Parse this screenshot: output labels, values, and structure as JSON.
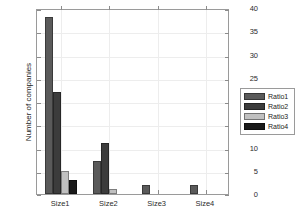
{
  "chart_data": {
    "type": "bar",
    "title": "",
    "xlabel": "",
    "ylabel": "Number of companies",
    "categories": [
      "Size1",
      "Size2",
      "Size3",
      "Size4"
    ],
    "series": [
      {
        "name": "Ratio1",
        "values": [
          38,
          7,
          2,
          2
        ],
        "color": "#5a5a5a"
      },
      {
        "name": "Ratio2",
        "values": [
          22,
          11,
          0,
          0
        ],
        "color": "#3c3c3c"
      },
      {
        "name": "Ratio3",
        "values": [
          5,
          1,
          0,
          0
        ],
        "color": "#c0c0c0"
      },
      {
        "name": "Ratio4",
        "values": [
          3,
          0,
          0,
          0
        ],
        "color": "#1a1a1a"
      }
    ],
    "ylim": [
      0,
      40
    ],
    "yticks": [
      0,
      5,
      10,
      15,
      20,
      25,
      30,
      35,
      40
    ],
    "ytick_labels": [
      "0",
      "5",
      "10",
      "15",
      "20",
      "25",
      "30",
      "35",
      "40"
    ],
    "grid": true,
    "legend_position": "right-outside",
    "legend_entries": [
      "Ratio1",
      "Ratio2",
      "Ratio3",
      "Ratio4"
    ],
    "axis_color": "#9a9a9a",
    "grid_color": "#ededed",
    "background": "#ffffff"
  }
}
